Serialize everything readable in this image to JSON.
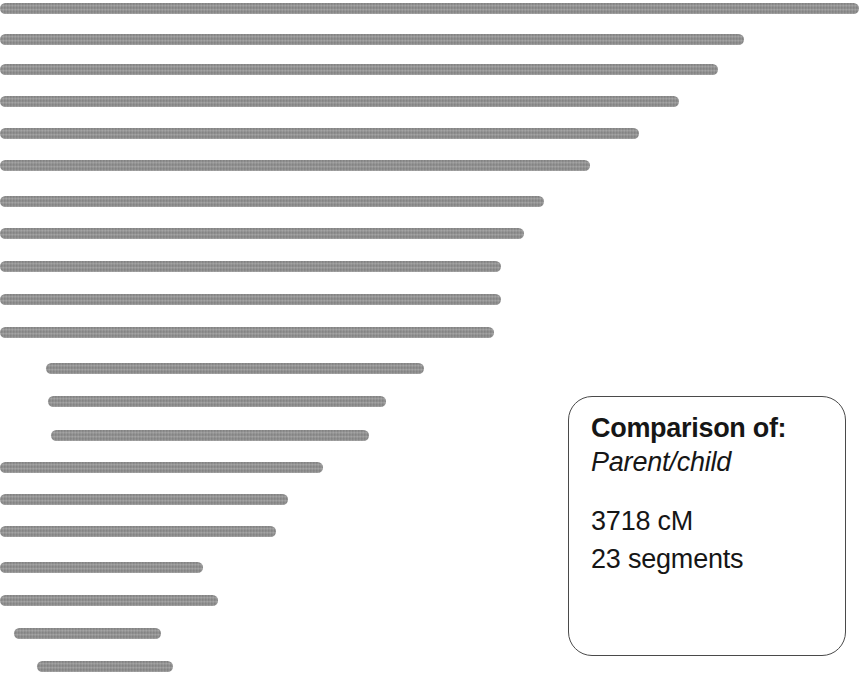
{
  "chart_data": {
    "type": "bar",
    "orientation": "horizontal",
    "title": "",
    "subtitle": "",
    "xlabel": "",
    "ylabel": "",
    "grid": false,
    "legend": null,
    "axis_visible": false,
    "units": "pixels",
    "bar_color": "#8b8b8b",
    "background_color": "#ffffff",
    "canvas": {
      "width": 859,
      "height": 677
    },
    "note": "Each bar is one matching chromosome segment, drawn as a floating span from start to end.",
    "categories": [
      "segment-1",
      "segment-2",
      "segment-3",
      "segment-4",
      "segment-5",
      "segment-6",
      "segment-7",
      "segment-8",
      "segment-9",
      "segment-10",
      "segment-11",
      "segment-12",
      "segment-13",
      "segment-14",
      "segment-15",
      "segment-16",
      "segment-17",
      "segment-18",
      "segment-19",
      "segment-20",
      "segment-21",
      "segment-22",
      "segment-23"
    ],
    "bars": [
      {
        "index": 1,
        "top": 3,
        "height": 11,
        "start": 0,
        "end": 859,
        "length": 859
      },
      {
        "index": 2,
        "top": 34,
        "height": 11,
        "start": 0,
        "end": 744,
        "length": 744
      },
      {
        "index": 3,
        "top": 64,
        "height": 11,
        "start": 0,
        "end": 718,
        "length": 718
      },
      {
        "index": 4,
        "top": 96,
        "height": 11,
        "start": 0,
        "end": 679,
        "length": 679
      },
      {
        "index": 5,
        "top": 128,
        "height": 11,
        "start": 0,
        "end": 639,
        "length": 639
      },
      {
        "index": 6,
        "top": 160,
        "height": 11,
        "start": 0,
        "end": 590,
        "length": 590
      },
      {
        "index": 7,
        "top": 196,
        "height": 11,
        "start": 0,
        "end": 544,
        "length": 544
      },
      {
        "index": 8,
        "top": 228,
        "height": 11,
        "start": 0,
        "end": 524,
        "length": 524
      },
      {
        "index": 9,
        "top": 261,
        "height": 11,
        "start": 0,
        "end": 501,
        "length": 501
      },
      {
        "index": 10,
        "top": 294,
        "height": 11,
        "start": 0,
        "end": 501,
        "length": 501
      },
      {
        "index": 11,
        "top": 327,
        "height": 11,
        "start": 0,
        "end": 494,
        "length": 494
      },
      {
        "index": 12,
        "top": 363,
        "height": 11,
        "start": 46,
        "end": 424,
        "length": 378
      },
      {
        "index": 13,
        "top": 396,
        "height": 11,
        "start": 48,
        "end": 386,
        "length": 338
      },
      {
        "index": 14,
        "top": 430,
        "height": 11,
        "start": 51,
        "end": 369,
        "length": 318
      },
      {
        "index": 15,
        "top": 462,
        "height": 11,
        "start": 0,
        "end": 323,
        "length": 323
      },
      {
        "index": 16,
        "top": 494,
        "height": 11,
        "start": 0,
        "end": 288,
        "length": 288
      },
      {
        "index": 17,
        "top": 526,
        "height": 11,
        "start": 0,
        "end": 276,
        "length": 276
      },
      {
        "index": 18,
        "top": 562,
        "height": 11,
        "start": 0,
        "end": 203,
        "length": 203
      },
      {
        "index": 19,
        "top": 595,
        "height": 11,
        "start": 0,
        "end": 218,
        "length": 218
      },
      {
        "index": 20,
        "top": 628,
        "height": 11,
        "start": 14,
        "end": 161,
        "length": 147
      },
      {
        "index": 21,
        "top": 661,
        "height": 11,
        "start": 37,
        "end": 173,
        "length": 136
      },
      {
        "index": 22,
        "top": 562,
        "height": 0,
        "start": 0,
        "end": 0,
        "length": 0
      },
      {
        "index": 23,
        "top": 562,
        "height": 0,
        "start": 0,
        "end": 0,
        "length": 0
      }
    ]
  },
  "callout": {
    "geometry": {
      "left": 568,
      "top": 396,
      "width": 278,
      "height": 260
    },
    "title_label": "Comparison of:",
    "relationship_label": "Parent/child",
    "total_cm_label": "3718 cM",
    "segments_label": "23 segments",
    "border_color": "#4a4a4a",
    "text_color": "#161616"
  }
}
